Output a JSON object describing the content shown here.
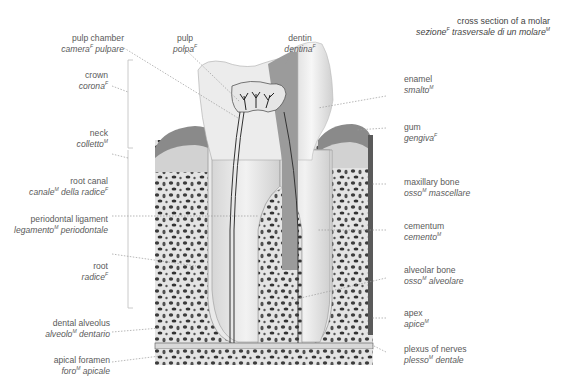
{
  "title": {
    "en": "cross section of a molar",
    "it": "sezione",
    "it_sup": "F",
    "it_rest": " trasversale di un molare",
    "it_rest_sup": "M"
  },
  "labels": {
    "pulp_chamber": {
      "en": "pulp chamber",
      "it": "camera",
      "sup": "F",
      "it2": " pulpare",
      "sup2": ""
    },
    "pulp": {
      "en": "pulp",
      "it": "polpa",
      "sup": "F"
    },
    "dentin": {
      "en": "dentin",
      "it": "dentina",
      "sup": "F"
    },
    "crown": {
      "en": "crown",
      "it": "corona",
      "sup": "F"
    },
    "neck": {
      "en": "neck",
      "it": "colletto",
      "sup": "M"
    },
    "root_canal": {
      "en": "root canal",
      "it": "canale",
      "sup": "M",
      "it2": " della radice",
      "sup2": "F"
    },
    "periodontal_ligament": {
      "en": "periodontal ligament",
      "it": "legamento",
      "sup": "M",
      "it2": " periodontale"
    },
    "root": {
      "en": "root",
      "it": "radice",
      "sup": "F"
    },
    "dental_alveolus": {
      "en": "dental alveolus",
      "it": "alveolo",
      "sup": "M",
      "it2": " dentario"
    },
    "apical_foramen": {
      "en": "apical foramen",
      "it": "foro",
      "sup": "M",
      "it2": " apicale"
    },
    "enamel": {
      "en": "enamel",
      "it": "smalto",
      "sup": "M"
    },
    "gum": {
      "en": "gum",
      "it": "gengiva",
      "sup": "F"
    },
    "maxillary_bone": {
      "en": "maxillary bone",
      "it": "osso",
      "sup": "M",
      "it2": " mascellare"
    },
    "cementum": {
      "en": "cementum",
      "it": "cemento",
      "sup": "M"
    },
    "alveolar_bone": {
      "en": "alveolar bone",
      "it": "osso",
      "sup": "M",
      "it2": " alveolare"
    },
    "apex": {
      "en": "apex",
      "it": "apice",
      "sup": "M"
    },
    "plexus_of_nerves": {
      "en": "plexus of nerves",
      "it": "plesso",
      "sup": "M",
      "it2": " dentale"
    }
  },
  "colors": {
    "bone": "#e6e6e6",
    "bone_pore": "#3a3a3a",
    "gum": "#8a8a8a",
    "dentin": "#9a9a9a",
    "enamel": "#f0f0f0",
    "pulp": "#e2e2e2",
    "leader": "#9a9a9a"
  }
}
